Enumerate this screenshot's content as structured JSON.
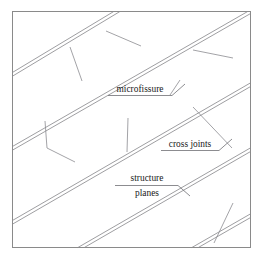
{
  "figure": {
    "title_visible": false,
    "background_color": "#ffffff",
    "frame": {
      "name": "figure-border",
      "color": "#8a8a8a",
      "x": 12.5,
      "y": 11.5,
      "width": 238,
      "height": 236
    },
    "line_color": "#8c8c90",
    "annotation_line_color": "#6f6f74",
    "text_color": "#1a1a1a"
  },
  "annotations": [
    {
      "id": "microfissure",
      "label": "microfissure",
      "text_x": 140,
      "text_y": 92,
      "underline": {
        "x1": 108,
        "y1": 95.5,
        "x2": 172,
        "y2": 95.5
      },
      "leader": [
        [
          172,
          95.5
        ],
        [
          185,
          84
        ]
      ]
    },
    {
      "id": "cross-joints",
      "label": "cross joints",
      "text_x": 190,
      "text_y": 147,
      "underline": {
        "x1": 161,
        "y1": 150.5,
        "x2": 219,
        "y2": 150.5
      },
      "leader": [
        [
          219,
          150.5
        ],
        [
          232,
          139
        ]
      ]
    },
    {
      "id": "structure-planes",
      "label_line1": "structure",
      "label_line2": "planes",
      "text1_x": 147,
      "text1_y": 181,
      "text2_x": 147,
      "text2_y": 196,
      "underline": {
        "x1": 115,
        "y1": 185.5,
        "x2": 178,
        "y2": 185.5
      },
      "leader": [
        [
          178,
          185.5
        ],
        [
          190,
          196
        ]
      ]
    }
  ],
  "chart_data": {
    "type": "diagram",
    "structure_planes": [
      {
        "name": "plane-1",
        "a": [
          13,
          74
        ],
        "b": [
          116,
          12
        ],
        "gap": 3.2
      },
      {
        "name": "plane-2",
        "a": [
          13,
          148
        ],
        "b": [
          250,
          12
        ],
        "gap": 3.2
      },
      {
        "name": "plane-3",
        "a": [
          13,
          222
        ],
        "b": [
          250,
          85
        ],
        "gap": 3.2
      },
      {
        "name": "plane-4",
        "a": [
          82,
          247
        ],
        "b": [
          250,
          150
        ],
        "gap": 3.2
      },
      {
        "name": "plane-5",
        "a": [
          196,
          247
        ],
        "b": [
          250,
          216
        ],
        "gap": 3.2
      }
    ],
    "cross_joints": [
      {
        "name": "cross-joint-1",
        "points": [
          [
            45,
            121
          ],
          [
            47,
            148
          ],
          [
            75,
            162
          ]
        ]
      },
      {
        "name": "cross-joint-2",
        "points": [
          [
            193,
            107
          ],
          [
            232,
            148
          ]
        ]
      }
    ],
    "microfissures": [
      {
        "name": "microfissure-1",
        "a": [
          70,
          47
        ],
        "b": [
          82,
          81
        ]
      },
      {
        "name": "microfissure-2",
        "a": [
          106,
          31
        ],
        "b": [
          141,
          46
        ]
      },
      {
        "name": "microfissure-3",
        "a": [
          193,
          50
        ],
        "b": [
          233,
          58
        ]
      },
      {
        "name": "microfissure-4",
        "a": [
          180,
          80
        ],
        "b": [
          170,
          95
        ]
      },
      {
        "name": "microfissure-5",
        "a": [
          128,
          118
        ],
        "b": [
          127,
          152
        ]
      },
      {
        "name": "microfissure-6",
        "a": [
          233,
          203
        ],
        "b": [
          214,
          243
        ]
      }
    ],
    "legend": [
      "microfissure",
      "cross joints",
      "structure planes"
    ]
  }
}
